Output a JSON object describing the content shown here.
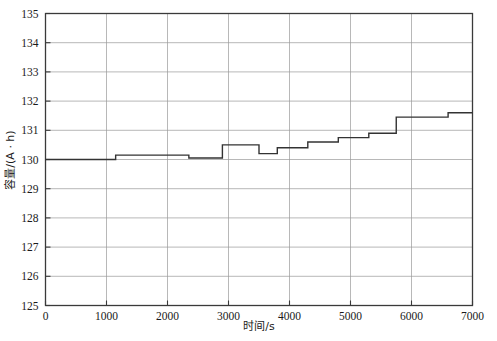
{
  "chart_data": {
    "type": "line",
    "subtype": "step",
    "title": "",
    "xlabel": "时间/s",
    "ylabel": "容量/(A · h)",
    "xlim": [
      0,
      7000
    ],
    "ylim": [
      125,
      135
    ],
    "xticks": [
      0,
      1000,
      2000,
      3000,
      4000,
      5000,
      6000,
      7000
    ],
    "yticks": [
      125,
      126,
      127,
      128,
      129,
      130,
      131,
      132,
      133,
      134,
      135
    ],
    "xtick_labels": [
      "0",
      "1000",
      "2000",
      "3000",
      "4000",
      "5000",
      "6000",
      "7000"
    ],
    "ytick_labels": [
      "125",
      "126",
      "127",
      "128",
      "129",
      "130",
      "131",
      "132",
      "133",
      "134",
      "135"
    ],
    "grid": true,
    "grid_color": "#9a9a9a",
    "legend": null,
    "line_color": "#333333",
    "line_width": 1.4,
    "series": [
      {
        "name": "容量",
        "x": [
          0,
          1150,
          1150,
          2350,
          2350,
          2900,
          2900,
          3500,
          3500,
          3800,
          3800,
          4300,
          4300,
          4800,
          4800,
          5300,
          5300,
          5750,
          5750,
          6000,
          6000,
          6600,
          6600,
          7000
        ],
        "y": [
          130.0,
          130.0,
          130.15,
          130.15,
          130.05,
          130.05,
          130.5,
          130.5,
          130.2,
          130.2,
          130.4,
          130.4,
          130.6,
          130.6,
          130.75,
          130.75,
          130.9,
          130.9,
          131.45,
          131.45,
          131.45,
          131.45,
          131.6,
          131.6
        ],
        "steps": [
          {
            "x_start": 0,
            "x_end": 1150,
            "value": 130.0
          },
          {
            "x_start": 1150,
            "x_end": 2350,
            "value": 130.15
          },
          {
            "x_start": 2350,
            "x_end": 2900,
            "value": 130.05
          },
          {
            "x_start": 2900,
            "x_end": 3500,
            "value": 130.5
          },
          {
            "x_start": 3500,
            "x_end": 3800,
            "value": 130.2
          },
          {
            "x_start": 3800,
            "x_end": 4300,
            "value": 130.4
          },
          {
            "x_start": 4300,
            "x_end": 4800,
            "value": 130.6
          },
          {
            "x_start": 4800,
            "x_end": 5300,
            "value": 130.75
          },
          {
            "x_start": 5300,
            "x_end": 5750,
            "value": 130.9
          },
          {
            "x_start": 5750,
            "x_end": 6600,
            "value": 131.45
          },
          {
            "x_start": 6600,
            "x_end": 7000,
            "value": 131.6
          }
        ]
      }
    ]
  },
  "axes": {
    "x_title": "时间/s",
    "y_title": "容量/(A · h)"
  }
}
